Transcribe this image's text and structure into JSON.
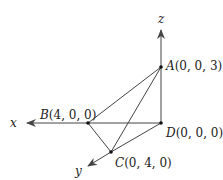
{
  "diagram": {
    "type": "3d-coordinate-tetrahedron",
    "axes": {
      "x": {
        "label": "x"
      },
      "y": {
        "label": "y"
      },
      "z": {
        "label": "z"
      }
    },
    "points": {
      "A": {
        "name": "A",
        "coords": "(0, 0, 3)"
      },
      "B": {
        "name": "B",
        "coords": "(4, 0, 0)"
      },
      "C": {
        "name": "C",
        "coords": "(0, 4, 0)"
      },
      "D": {
        "name": "D",
        "coords": "(0, 0, 0)"
      }
    },
    "edges": [
      "AB",
      "AC",
      "AD",
      "BD",
      "BC",
      "CD"
    ],
    "colors": {
      "line": "#444444",
      "point": "#111111",
      "text": "#222222"
    }
  }
}
